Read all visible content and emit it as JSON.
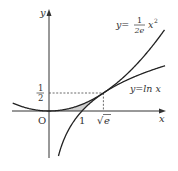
{
  "diagram": {
    "title": "",
    "axes": {
      "x_label": "x",
      "y_label": "y",
      "origin_label": "O"
    },
    "ticks": {
      "x_one": "1",
      "x_sqrt_e_radical": "√",
      "x_sqrt_e_arg": "e",
      "y_half_num": "1",
      "y_half_den": "2"
    },
    "curves": [
      {
        "name": "parabola",
        "label_lhs": "y=",
        "label_frac_num": "1",
        "label_frac_den": "2e",
        "label_tail": "x",
        "label_exp": "2",
        "formula": "y = x^2 / (2e)"
      },
      {
        "name": "log",
        "label": "y=ln x",
        "formula": "y = ln x"
      }
    ],
    "tangent_point": {
      "x": "√e",
      "y": "1/2"
    },
    "shaded_region": "area between y = x^2/(2e), y = ln x and the x-axis from x=0 to x=√e",
    "colors": {
      "curve": "#222222",
      "axis": "#333333",
      "shade": "#c8c8c8",
      "dash": "#444444"
    }
  }
}
